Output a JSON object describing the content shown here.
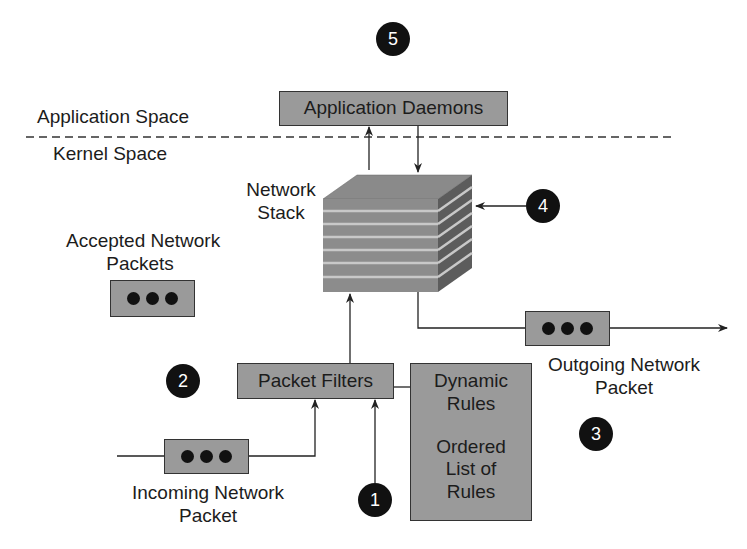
{
  "regions": {
    "application_space": "Application Space",
    "kernel_space": "Kernel Space"
  },
  "components": {
    "application_daemons": "Application Daemons",
    "network_stack_line1": "Network",
    "network_stack_line2": "Stack",
    "packet_filters": "Packet Filters",
    "rules_dynamic_line1": "Dynamic",
    "rules_dynamic_line2": "Rules",
    "rules_ordered_line1": "Ordered",
    "rules_ordered_line2": "List of",
    "rules_ordered_line3": "Rules"
  },
  "packets": {
    "accepted_line1": "Accepted Network",
    "accepted_line2": "Packets",
    "incoming_line1": "Incoming Network",
    "incoming_line2": "Packet",
    "outgoing_line1": "Outgoing Network",
    "outgoing_line2": "Packet"
  },
  "badges": {
    "b1": "1",
    "b2": "2",
    "b3": "3",
    "b4": "4",
    "b5": "5"
  },
  "colors": {
    "box_fill": "#9a9a9a",
    "stroke": "#333333",
    "badge": "#111111"
  }
}
